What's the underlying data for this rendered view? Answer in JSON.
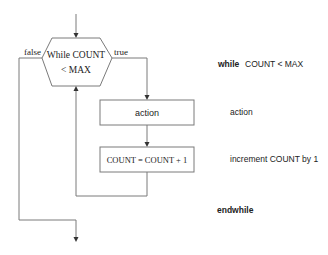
{
  "flowchart": {
    "decision": {
      "line1": "While COUNT",
      "line2": "< MAX"
    },
    "false_label": "false",
    "true_label": "true",
    "action_box": "action",
    "increment_box": "COUNT = COUNT + 1"
  },
  "pseudocode": {
    "while_keyword": "while",
    "while_condition": "COUNT < MAX",
    "action": "action",
    "increment": "increment COUNT by 1",
    "endwhile_keyword": "endwhile"
  },
  "colors": {
    "line": "#7a7a7a",
    "text": "#222222",
    "background": "#ffffff"
  }
}
